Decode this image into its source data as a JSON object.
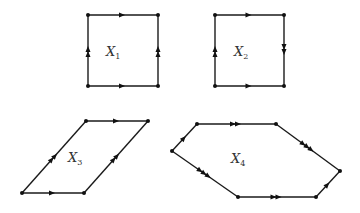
{
  "figures": [
    {
      "id": "X1",
      "label": "X",
      "subscript": "1",
      "label_pos": [
        113,
        56
      ],
      "vertices": [
        [
          88,
          15
        ],
        [
          158,
          15
        ],
        [
          158,
          86
        ],
        [
          88,
          86
        ]
      ],
      "edges": [
        {
          "from": 3,
          "to": 2,
          "arrows": 1
        },
        {
          "from": 0,
          "to": 1,
          "arrows": 1
        },
        {
          "from": 3,
          "to": 0,
          "arrows": 2
        },
        {
          "from": 2,
          "to": 1,
          "arrows": 2
        }
      ]
    },
    {
      "id": "X2",
      "label": "X",
      "subscript": "2",
      "label_pos": [
        241,
        56
      ],
      "vertices": [
        [
          215,
          15
        ],
        [
          284,
          15
        ],
        [
          284,
          86
        ],
        [
          215,
          86
        ]
      ],
      "edges": [
        {
          "from": 0,
          "to": 1,
          "arrows": 1
        },
        {
          "from": 3,
          "to": 2,
          "arrows": 1
        },
        {
          "from": 3,
          "to": 0,
          "arrows": 2
        },
        {
          "from": 1,
          "to": 2,
          "arrows": 2
        }
      ]
    },
    {
      "id": "X3",
      "label": "X",
      "subscript": "3",
      "label_pos": [
        75,
        162
      ],
      "vertices": [
        [
          22,
          193
        ],
        [
          84,
          193
        ],
        [
          148,
          121
        ],
        [
          86,
          121
        ]
      ],
      "edges": [
        {
          "from": 0,
          "to": 1,
          "arrows": 1
        },
        {
          "from": 3,
          "to": 2,
          "arrows": 1
        },
        {
          "from": 0,
          "to": 3,
          "arrows": 2
        },
        {
          "from": 1,
          "to": 2,
          "arrows": 2
        }
      ]
    },
    {
      "id": "X4",
      "label": "X",
      "subscript": "4",
      "label_pos": [
        238,
        163
      ],
      "vertices": [
        [
          172,
          151
        ],
        [
          197,
          124
        ],
        [
          276,
          124
        ],
        [
          340,
          171
        ],
        [
          316,
          197
        ],
        [
          238,
          197
        ]
      ],
      "edges": [
        {
          "from": 0,
          "to": 1,
          "arrows": 1
        },
        {
          "from": 1,
          "to": 2,
          "arrows": 2
        },
        {
          "from": 2,
          "to": 3,
          "arrows": 3
        },
        {
          "from": 4,
          "to": 3,
          "arrows": 1
        },
        {
          "from": 5,
          "to": 4,
          "arrows": 2
        },
        {
          "from": 0,
          "to": 5,
          "arrows": 3
        }
      ]
    }
  ]
}
